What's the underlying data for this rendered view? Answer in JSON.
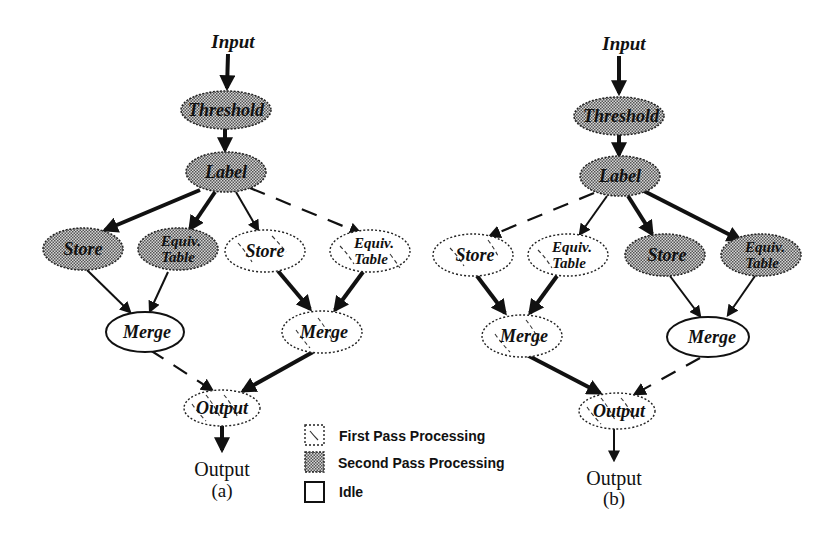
{
  "figure": {
    "panels": [
      {
        "id": "a",
        "caption": "(a)",
        "input_label": "Input",
        "output_label": "Output",
        "nodes": {
          "threshold": {
            "label": "Threshold",
            "state": "second"
          },
          "label": {
            "label": "Label",
            "state": "second"
          },
          "store1": {
            "label": "Store",
            "state": "second"
          },
          "equiv1": {
            "label1": "Equiv.",
            "label2": "Table",
            "state": "second"
          },
          "store2": {
            "label": "Store",
            "state": "first"
          },
          "equiv2": {
            "label1": "Equiv.",
            "label2": "Table",
            "state": "first"
          },
          "merge1": {
            "label": "Merge",
            "state": "idle"
          },
          "merge2": {
            "label": "Merge",
            "state": "first"
          },
          "output": {
            "label": "Output",
            "state": "first"
          }
        }
      },
      {
        "id": "b",
        "caption": "(b)",
        "input_label": "Input",
        "output_label": "Output",
        "nodes": {
          "threshold": {
            "label": "Threshold",
            "state": "second"
          },
          "label": {
            "label": "Label",
            "state": "second"
          },
          "store1": {
            "label": "Store",
            "state": "first"
          },
          "equiv1": {
            "label1": "Equiv.",
            "label2": "Table",
            "state": "first"
          },
          "store2": {
            "label": "Store",
            "state": "second"
          },
          "equiv2": {
            "label1": "Equiv.",
            "label2": "Table",
            "state": "second"
          },
          "merge1": {
            "label": "Merge",
            "state": "first"
          },
          "merge2": {
            "label": "Merge",
            "state": "idle"
          },
          "output": {
            "label": "Output",
            "state": "first"
          }
        }
      }
    ],
    "legend": [
      {
        "key": "first",
        "label": "First Pass Processing"
      },
      {
        "key": "second",
        "label": "Second Pass Processing"
      },
      {
        "key": "idle",
        "label": "Idle"
      }
    ],
    "colors": {
      "ink": "#111111",
      "background": "#ffffff",
      "checker_dark": "#555555",
      "checker_light": "#d8d8d8"
    }
  }
}
